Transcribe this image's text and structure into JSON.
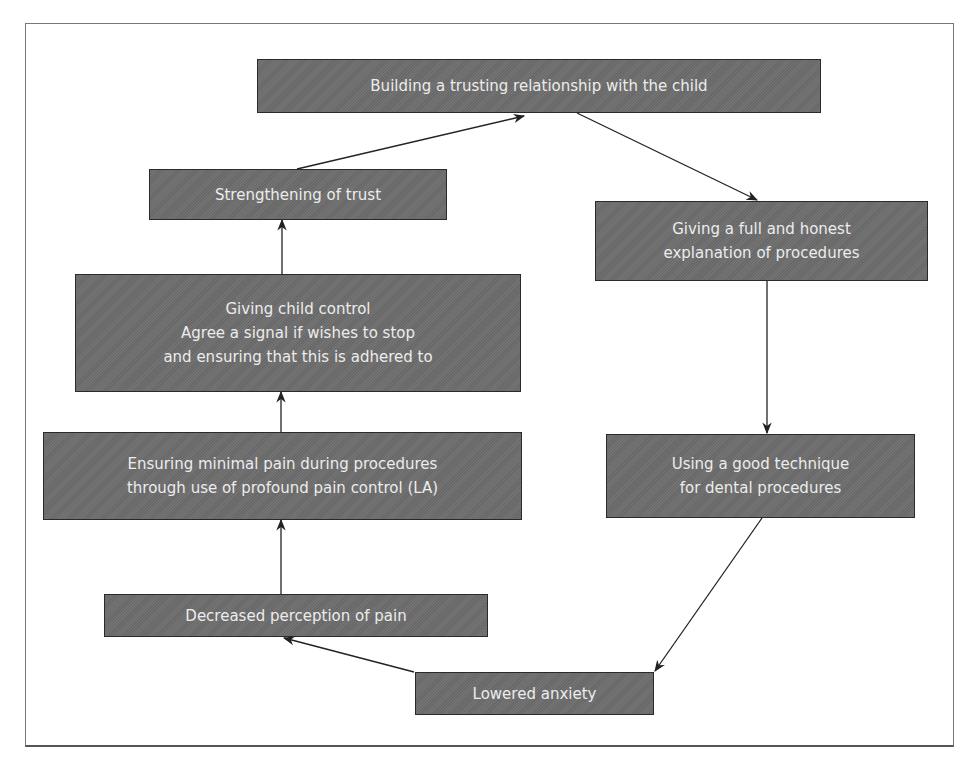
{
  "diagram": {
    "type": "cycle-flowchart",
    "colors": {
      "node_fill": "#6d6d6d",
      "node_text": "#ececec",
      "node_border": "#2a2a2a",
      "arrow": "#222222",
      "frame": "#777777"
    },
    "nodes": [
      {
        "id": "n1",
        "label": "Building a trusting relationship with the child"
      },
      {
        "id": "n2",
        "label": "Giving a full and honest\nexplanation of procedures"
      },
      {
        "id": "n3",
        "label": "Using a good technique\nfor dental procedures"
      },
      {
        "id": "n4",
        "label": "Lowered anxiety"
      },
      {
        "id": "n5",
        "label": "Decreased perception of pain"
      },
      {
        "id": "n6",
        "label": "Ensuring minimal pain during procedures\nthrough use of profound pain control (LA)"
      },
      {
        "id": "n7",
        "label": "Giving child control\nAgree a signal if wishes to stop\nand ensuring that this is adhered to"
      },
      {
        "id": "n8",
        "label": "Strengthening of trust"
      }
    ],
    "edges": [
      {
        "from": "n1",
        "to": "n2"
      },
      {
        "from": "n2",
        "to": "n3"
      },
      {
        "from": "n3",
        "to": "n4"
      },
      {
        "from": "n4",
        "to": "n5"
      },
      {
        "from": "n5",
        "to": "n6"
      },
      {
        "from": "n6",
        "to": "n7"
      },
      {
        "from": "n7",
        "to": "n8"
      },
      {
        "from": "n8",
        "to": "n1"
      }
    ]
  }
}
